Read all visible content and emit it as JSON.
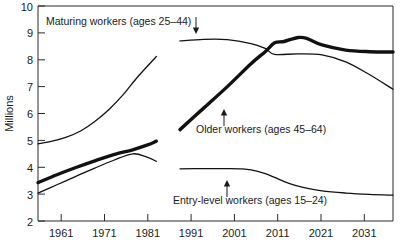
{
  "chart_data": {
    "type": "line",
    "title": "",
    "xlabel": "",
    "ylabel": "Millions",
    "xlim": [
      1961,
      2036
    ],
    "ylim": [
      2,
      10
    ],
    "grid": false,
    "legend_position": "inline-annotations",
    "y_ticks": [
      "10",
      "9",
      "8",
      "7",
      "6",
      "5",
      "4",
      "3",
      "2"
    ],
    "x_ticks": [
      "1961",
      "1971",
      "1981",
      "1991",
      "2001",
      "2011",
      "2021",
      "2031"
    ],
    "series": [
      {
        "name": "Maturing workers (ages 25–44)",
        "style": "thin",
        "annotation_arrow": "down",
        "segments": [
          {
            "period": "historical",
            "x": [
              1961,
              1964,
              1967,
              1970,
              1973,
              1976,
              1979,
              1982,
              1986
            ],
            "y": [
              4.87,
              4.97,
              5.12,
              5.35,
              5.7,
              6.15,
              6.7,
              7.35,
              8.12
            ]
          },
          {
            "period": "projected",
            "x": [
              1991,
              1996,
              2001,
              2006,
              2009,
              2011,
              2016,
              2021,
              2026,
              2031,
              2036
            ],
            "y": [
              8.7,
              8.76,
              8.75,
              8.6,
              8.42,
              8.2,
              8.22,
              8.18,
              7.92,
              7.45,
              6.9
            ]
          }
        ]
      },
      {
        "name": "Older workers (ages 45–64)",
        "style": "thick",
        "annotation_arrow": "up",
        "segments": [
          {
            "period": "historical",
            "x": [
              1961,
              1965,
              1969,
              1973,
              1977,
              1981,
              1984,
              1986
            ],
            "y": [
              3.43,
              3.72,
              3.99,
              4.24,
              4.47,
              4.65,
              4.82,
              4.97
            ]
          },
          {
            "period": "projected",
            "x": [
              1991,
              1996,
              2001,
              2006,
              2009,
              2011,
              2013,
              2016,
              2018,
              2021,
              2026,
              2031,
              2036
            ],
            "y": [
              5.4,
              6.2,
              7.0,
              7.85,
              8.3,
              8.63,
              8.68,
              8.83,
              8.78,
              8.55,
              8.36,
              8.3,
              8.29
            ]
          }
        ]
      },
      {
        "name": "Entry-level workers (ages 15–24)",
        "style": "thin",
        "annotation_arrow": "up",
        "segments": [
          {
            "period": "historical",
            "x": [
              1961,
              1965,
              1969,
              1973,
              1977,
              1981,
              1984,
              1986
            ],
            "y": [
              3.04,
              3.35,
              3.66,
              3.97,
              4.26,
              4.5,
              4.38,
              4.22
            ]
          },
          {
            "period": "projected",
            "x": [
              1991,
              1996,
              2001,
              2004,
              2006,
              2009,
              2011,
              2014,
              2017,
              2021,
              2026,
              2031,
              2036
            ],
            "y": [
              3.94,
              3.95,
              3.95,
              3.94,
              3.9,
              3.76,
              3.62,
              3.4,
              3.25,
              3.12,
              3.04,
              2.99,
              2.96
            ]
          }
        ]
      }
    ]
  },
  "labels": {
    "maturing": "Maturing workers (ages 25–44)",
    "older": "Older workers (ages 45–64)",
    "entry": "Entry-level workers (ages 15–24)",
    "y_axis_title": "Millions"
  },
  "axis": {
    "y_tick_10": "10",
    "y_tick_9": "9",
    "y_tick_8": "8",
    "y_tick_7": "7",
    "y_tick_6": "6",
    "y_tick_5": "5",
    "y_tick_4": "4",
    "y_tick_3": "3",
    "y_tick_2": "2",
    "x_tick_1961": "1961",
    "x_tick_1971": "1971",
    "x_tick_1981": "1981",
    "x_tick_1991": "1991",
    "x_tick_2001": "2001",
    "x_tick_2011": "2011",
    "x_tick_2021": "2021",
    "x_tick_2031": "2031"
  },
  "colors": {
    "ink": "#111111",
    "frame": "#2b2b2b",
    "background": "#ffffff"
  }
}
